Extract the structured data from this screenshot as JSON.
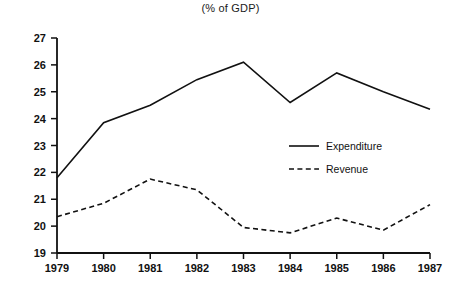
{
  "chart_data": {
    "type": "line",
    "title": "(% of GDP)",
    "xlabel": "",
    "ylabel": "",
    "x": [
      1979,
      1980,
      1981,
      1982,
      1983,
      1984,
      1985,
      1986,
      1987
    ],
    "xtick_labels": [
      "1979",
      "1980",
      "1981",
      "1982",
      "1983",
      "1984",
      "1985",
      "1986",
      "1987"
    ],
    "ytick_labels": [
      "27",
      "26",
      "25",
      "24",
      "23",
      "22",
      "21",
      "20",
      "19"
    ],
    "yticks": [
      27,
      26,
      25,
      24,
      23,
      22,
      21,
      20,
      19
    ],
    "ylim": [
      19,
      27
    ],
    "xlim": [
      1979,
      1987
    ],
    "grid": false,
    "legend_position": "center-right",
    "series": [
      {
        "name": "Expenditure",
        "style": "solid",
        "color": "#111111",
        "values": [
          21.8,
          23.85,
          24.5,
          25.45,
          26.1,
          24.6,
          25.7,
          25.0,
          24.35
        ]
      },
      {
        "name": "Revenue",
        "style": "dashed",
        "color": "#111111",
        "values": [
          20.35,
          20.85,
          21.75,
          21.35,
          19.95,
          19.75,
          20.3,
          19.85,
          20.8
        ]
      }
    ]
  },
  "legend": {
    "entries": [
      {
        "label": "Expenditure",
        "style": "solid"
      },
      {
        "label": "Revenue",
        "style": "dashed"
      }
    ]
  }
}
